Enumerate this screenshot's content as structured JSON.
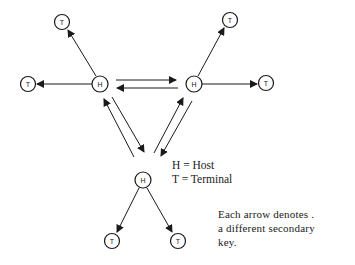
{
  "diagram": {
    "type": "network",
    "nodes": [
      {
        "id": "H1",
        "label": "H",
        "x": 100,
        "y": 84
      },
      {
        "id": "H2",
        "label": "H",
        "x": 194,
        "y": 84
      },
      {
        "id": "H3",
        "label": "H",
        "x": 143,
        "y": 180
      },
      {
        "id": "T1",
        "label": "T",
        "x": 62,
        "y": 22
      },
      {
        "id": "T2",
        "label": "T",
        "x": 28,
        "y": 84
      },
      {
        "id": "T3",
        "label": "T",
        "x": 230,
        "y": 20
      },
      {
        "id": "T4",
        "label": "T",
        "x": 266,
        "y": 83
      },
      {
        "id": "T5",
        "label": "T",
        "x": 112,
        "y": 241
      },
      {
        "id": "T6",
        "label": "T",
        "x": 178,
        "y": 241
      }
    ],
    "edges": [
      {
        "from": "H1",
        "to": "T1"
      },
      {
        "from": "H1",
        "to": "T2"
      },
      {
        "from": "H2",
        "to": "T3"
      },
      {
        "from": "H2",
        "to": "T4"
      },
      {
        "from": "H3",
        "to": "T5"
      },
      {
        "from": "H3",
        "to": "T6"
      },
      {
        "from": "H1",
        "to": "H2"
      },
      {
        "from": "H2",
        "to": "H1"
      },
      {
        "from": "H1",
        "to": "H3"
      },
      {
        "from": "H3",
        "to": "H1"
      },
      {
        "from": "H2",
        "to": "H3"
      },
      {
        "from": "H3",
        "to": "H2"
      }
    ]
  },
  "legend": {
    "line1": "H = Host",
    "line2": "T = Terminal"
  },
  "note": {
    "line1": "Each arrow denotes .",
    "line2": "a different secondary",
    "line3": "key."
  }
}
